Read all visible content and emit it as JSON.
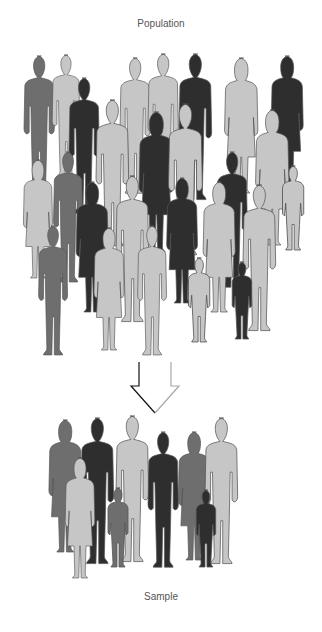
{
  "title_top": "Population",
  "title_bottom": "Sample",
  "colors": {
    "light": "#c6c6c6",
    "medium": "#6e6e6e",
    "dark": "#2e2e2e",
    "outline": "#555555",
    "background": "#ffffff"
  },
  "population": {
    "count": 27,
    "tones": [
      "light",
      "medium",
      "dark"
    ]
  },
  "arrow": {
    "direction": "down",
    "style": "outline"
  },
  "sample": {
    "count": 8,
    "tones": [
      "light",
      "medium",
      "dark"
    ]
  }
}
